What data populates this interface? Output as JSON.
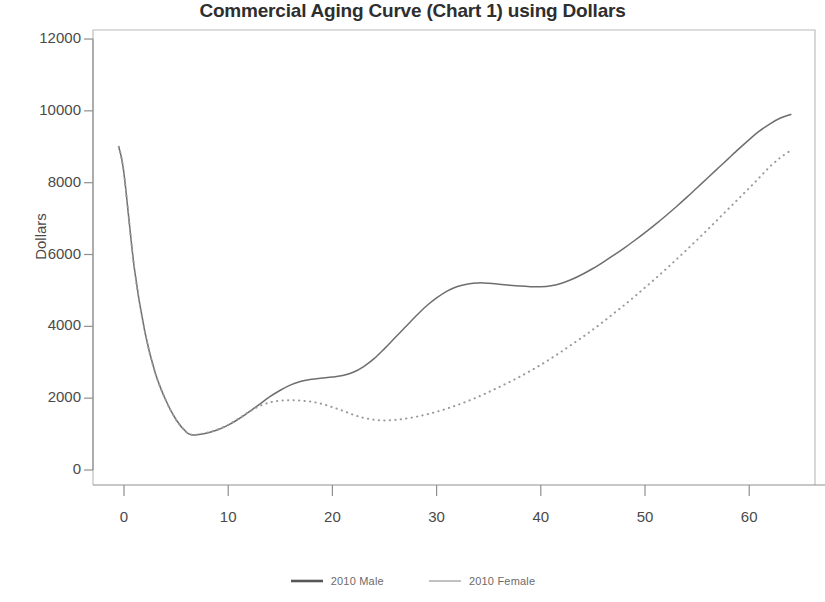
{
  "chart_data": {
    "type": "line",
    "title": "Commercial Aging Curve (Chart 1) using Dollars",
    "xlabel": "",
    "ylabel": "Dollars",
    "xlim": [
      -1,
      65
    ],
    "ylim": [
      0,
      12000
    ],
    "xticks": [
      0,
      10,
      20,
      30,
      40,
      50,
      60
    ],
    "yticks": [
      0,
      2000,
      4000,
      6000,
      8000,
      10000,
      12000
    ],
    "xtick_labels": [
      "0",
      "10",
      "20",
      "30",
      "40",
      "50",
      "60"
    ],
    "ytick_labels": [
      "0",
      "2000",
      "4000",
      "6000",
      "8000",
      "10000",
      "12000"
    ],
    "grid": false,
    "legend_position": "bottom",
    "series": [
      {
        "name": "2010 Male",
        "style": "solid",
        "color": "#6e6e6e",
        "x": [
          -0.5,
          0,
          1,
          2,
          3,
          4,
          5,
          6,
          6.5,
          7,
          8,
          9,
          10,
          11,
          12,
          13,
          14,
          15,
          16,
          17,
          18,
          19,
          20,
          21,
          22,
          23,
          24,
          25,
          26,
          27,
          28,
          29,
          30,
          31,
          32,
          33,
          34,
          35,
          36,
          37,
          38,
          39,
          40,
          41,
          42,
          43,
          44,
          45,
          46,
          47,
          48,
          49,
          50,
          51,
          52,
          53,
          54,
          55,
          56,
          57,
          58,
          59,
          60,
          61,
          62,
          63,
          64
        ],
        "y": [
          9000,
          8250,
          5600,
          3850,
          2700,
          1950,
          1400,
          1050,
          980,
          980,
          1030,
          1120,
          1250,
          1420,
          1620,
          1830,
          2040,
          2220,
          2370,
          2470,
          2530,
          2560,
          2590,
          2630,
          2720,
          2880,
          3100,
          3380,
          3680,
          3980,
          4280,
          4560,
          4790,
          4980,
          5110,
          5180,
          5210,
          5200,
          5175,
          5145,
          5120,
          5105,
          5100,
          5130,
          5200,
          5310,
          5450,
          5610,
          5790,
          5980,
          6180,
          6390,
          6610,
          6840,
          7080,
          7330,
          7590,
          7860,
          8130,
          8400,
          8670,
          8940,
          9200,
          9440,
          9640,
          9800,
          9900
        ]
      },
      {
        "name": "2010 Female",
        "style": "dotted",
        "color": "#9a9a9a",
        "x": [
          -0.5,
          0,
          1,
          2,
          3,
          4,
          5,
          6,
          6.5,
          7,
          8,
          9,
          10,
          11,
          12,
          13,
          14,
          15,
          16,
          17,
          18,
          19,
          20,
          21,
          22,
          23,
          24,
          25,
          26,
          27,
          28,
          29,
          30,
          31,
          32,
          33,
          34,
          35,
          36,
          37,
          38,
          39,
          40,
          41,
          42,
          43,
          44,
          45,
          46,
          47,
          48,
          49,
          50,
          51,
          52,
          53,
          54,
          55,
          56,
          57,
          58,
          59,
          60,
          61,
          62,
          63,
          64
        ],
        "y": [
          9000,
          8250,
          5600,
          3850,
          2700,
          1950,
          1400,
          1050,
          980,
          985,
          1040,
          1130,
          1260,
          1430,
          1620,
          1780,
          1880,
          1930,
          1940,
          1930,
          1900,
          1840,
          1750,
          1650,
          1540,
          1450,
          1400,
          1380,
          1395,
          1430,
          1480,
          1545,
          1620,
          1710,
          1810,
          1920,
          2040,
          2170,
          2310,
          2450,
          2600,
          2760,
          2930,
          3110,
          3300,
          3500,
          3700,
          3910,
          4130,
          4360,
          4590,
          4830,
          5080,
          5330,
          5590,
          5860,
          6130,
          6410,
          6690,
          6980,
          7270,
          7560,
          7850,
          8150,
          8450,
          8700,
          8900
        ]
      }
    ]
  },
  "legend": {
    "items": [
      {
        "label": "2010 Male",
        "style": "solid",
        "color": "#575757"
      },
      {
        "label": "2010 Female",
        "style": "solid-light",
        "color": "#a6a6a6"
      }
    ]
  },
  "axes": {
    "frame_color": "#b9b9b9",
    "tick_color": "#8f8f8f",
    "text_color": "#4a4a4a"
  }
}
